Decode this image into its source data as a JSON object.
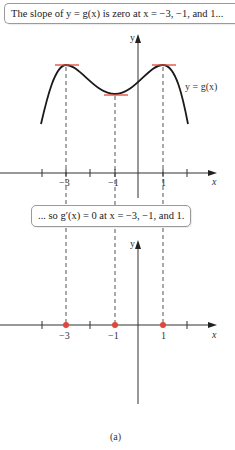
{
  "callouts": {
    "top": "The slope of y = g(x) is zero at x = −3, −1, and 1...",
    "middle": "... so g′(x) = 0 at x = −3, −1, and 1."
  },
  "graph_top": {
    "curve_label": "y = g(x)",
    "x_axis_label": "x",
    "y_axis_label": "y",
    "tick_labels": [
      "−3",
      "−1",
      "1"
    ]
  },
  "graph_bottom": {
    "x_axis_label": "x",
    "y_axis_label": "y",
    "tick_labels": [
      "−3",
      "−1",
      "1"
    ]
  },
  "subfigure_label": "(a)",
  "colors": {
    "curve": "#1a1a1a",
    "tangent": "#e0463a",
    "zero_points": "#e0463a",
    "axis": "#333333",
    "dashed": "#555555"
  }
}
